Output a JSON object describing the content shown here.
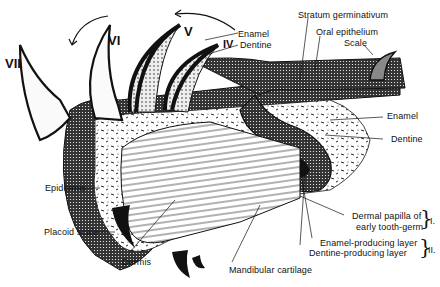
{
  "figure": {
    "tooth_numerals": [
      "VII",
      "VI",
      "V",
      "IV"
    ],
    "labels": {
      "enamel_top": "Enamel",
      "dentine_top": "Dentine",
      "stratum": "Stratum germinativum",
      "oral_epithelium": "Oral epithelium",
      "scale": "Scale",
      "enamel_right": "Enamel",
      "dentine_right": "Dentine",
      "epidermis": "Epidermis",
      "placoid_scale": "Placoid scale",
      "dermis": "Dermis",
      "mandibular_cartilage": "Mandibular cartilage",
      "dermal_papilla_1": "Dermal papilla of",
      "dermal_papilla_2": "early tooth-germ",
      "enamel_layer": "Enamel-producing layer",
      "dentine_layer": "Dentine-producing layer"
    },
    "groups": {
      "group1": "I.",
      "group2": "II."
    },
    "colors": {
      "ink": "#111111",
      "paper": "#ffffff"
    }
  }
}
